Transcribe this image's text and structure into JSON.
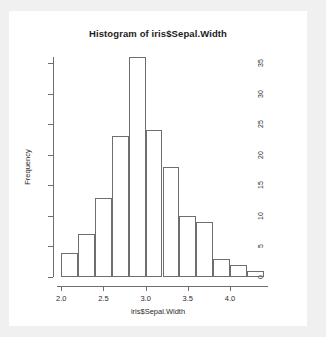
{
  "chart_data": {
    "type": "bar",
    "subtype": "histogram",
    "title": "Histogram of iris$Sepal.Width",
    "xlabel": "iris$Sepal.Width",
    "ylabel": "Frequency",
    "grid": false,
    "legend": null,
    "xlim": [
      1.95,
      4.45
    ],
    "ylim": [
      0,
      36
    ],
    "bin_width": 0.2,
    "bin_edges": [
      2.0,
      2.2,
      2.4,
      2.6,
      2.8,
      3.0,
      3.2,
      3.4,
      3.6,
      3.8,
      4.0,
      4.2,
      4.4
    ],
    "categories": [
      "2.0-2.2",
      "2.2-2.4",
      "2.4-2.6",
      "2.6-2.8",
      "2.8-3.0",
      "3.0-3.2",
      "3.2-3.4",
      "3.4-3.6",
      "3.6-3.8",
      "3.8-4.0",
      "4.0-4.2",
      "4.2-4.4"
    ],
    "bin_centers": [
      2.1,
      2.3,
      2.5,
      2.7,
      2.9,
      3.1,
      3.3,
      3.5,
      3.7,
      3.9,
      4.1,
      4.3
    ],
    "values": [
      4,
      7,
      13,
      23,
      36,
      24,
      18,
      10,
      9,
      3,
      2,
      1
    ],
    "x_ticks": [
      {
        "value": 2.0,
        "label": "2.0"
      },
      {
        "value": 2.5,
        "label": "2.5"
      },
      {
        "value": 3.0,
        "label": "3.0"
      },
      {
        "value": 3.5,
        "label": "3.5"
      },
      {
        "value": 4.0,
        "label": "4.0"
      }
    ],
    "y_ticks": [
      {
        "value": 0,
        "label": "0"
      },
      {
        "value": 5,
        "label": "5"
      },
      {
        "value": 10,
        "label": "10"
      },
      {
        "value": 15,
        "label": "15"
      },
      {
        "value": 20,
        "label": "20"
      },
      {
        "value": 25,
        "label": "25"
      },
      {
        "value": 30,
        "label": "30"
      },
      {
        "value": 35,
        "label": "35"
      }
    ],
    "colors": {
      "bar_border": "#6e6e6e",
      "bar_fill": "transparent",
      "axis": "#6e6e6e",
      "text": "#2b2b2b",
      "plot_background": "#ffffff",
      "page_background": "#f0f0f0"
    }
  }
}
